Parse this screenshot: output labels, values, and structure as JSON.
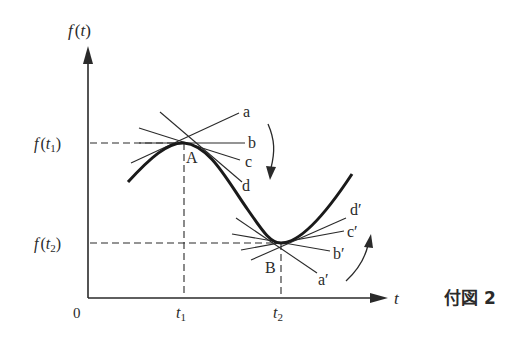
{
  "figure": {
    "caption": "付図 2",
    "axes": {
      "y_label_f": "f",
      "y_label_arg": "(t)",
      "x_label": "t",
      "origin_label": "0",
      "x_ticks": [
        {
          "base": "t",
          "sub": "1"
        },
        {
          "base": "t",
          "sub": "2"
        }
      ],
      "y_ticks": [
        {
          "f": "f",
          "open": "(",
          "base": "t",
          "sub": "1",
          "close": ")"
        },
        {
          "f": "f",
          "open": "(",
          "base": "t",
          "sub": "2",
          "close": ")"
        }
      ]
    },
    "points": {
      "A": "A",
      "B": "B"
    },
    "tangent_labels_A": [
      "a",
      "b",
      "c",
      "d"
    ],
    "tangent_labels_B": [
      "a′",
      "b′",
      "c′",
      "d′"
    ],
    "colors": {
      "ink": "#2a2a2a",
      "background": "#ffffff"
    }
  }
}
